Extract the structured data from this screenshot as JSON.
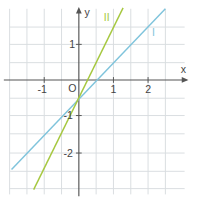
{
  "labels": {
    "x_axis": "x",
    "y_axis": "y",
    "origin": "O",
    "line1": "I",
    "line2": "II"
  },
  "ticks": {
    "x": [
      "-1",
      "1",
      "2"
    ],
    "y": [
      "1",
      "-1",
      "-2"
    ]
  },
  "colors": {
    "grid": "#d8dde0",
    "axis": "#555555",
    "line1": "#7fc4dc",
    "line2": "#a6c840"
  },
  "lines": [
    {
      "name": "I",
      "from": [
        12,
        172
      ],
      "to": [
        172,
        5
      ]
    },
    {
      "name": "II",
      "from": [
        35,
        193
      ],
      "to": [
        128,
        4
      ]
    }
  ]
}
